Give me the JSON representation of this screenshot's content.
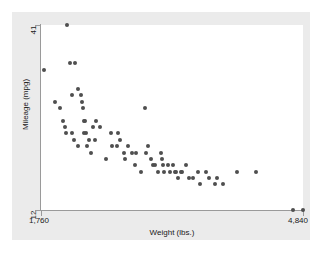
{
  "chart_data": {
    "type": "scatter",
    "title": "",
    "xlabel": "Weight (lbs.)",
    "ylabel": "Mileage (mpg)",
    "xlim": [
      1760,
      4840
    ],
    "ylim": [
      12,
      41
    ],
    "xticks": [
      1760,
      4840
    ],
    "xtick_labels": [
      "1,760",
      "4,840"
    ],
    "yticks": [
      12,
      41
    ],
    "ytick_labels": [
      "12",
      "41"
    ],
    "grid": false,
    "legend": "none",
    "marker": "filled-circle",
    "marker_color": "#4f4f4f",
    "plot_background": "#ffffff",
    "graph_background": "#ebebeb",
    "axis_color": "#9a9a9a",
    "n_points": 74,
    "series": [
      {
        "name": "Automobiles",
        "x": [
          2070,
          2100,
          2160,
          2200,
          2230,
          2250,
          2280,
          2290,
          2370,
          2400,
          1800,
          1930,
          1980,
          2020,
          2040,
          2050,
          2120,
          2130,
          2150,
          2190,
          2240,
          2260,
          2270,
          2300,
          2320,
          2350,
          2410,
          2450,
          2520,
          2580,
          2600,
          2650,
          2670,
          2690,
          2730,
          2750,
          2780,
          2830,
          2860,
          2880,
          2930,
          2980,
          3000,
          3020,
          3050,
          3080,
          3100,
          3130,
          3170,
          3180,
          3200,
          3210,
          3250,
          3280,
          3310,
          3330,
          3350,
          3370,
          3400,
          3420,
          3470,
          3500,
          3550,
          3600,
          3630,
          3700,
          3730,
          3800,
          3830,
          3900,
          4060,
          4290,
          4720,
          4840
        ],
        "y": [
          41,
          35,
          35,
          31,
          30,
          28,
          26,
          24,
          25,
          23,
          34,
          29,
          28,
          26,
          25,
          24,
          30,
          24,
          23,
          22,
          29,
          26,
          24,
          22,
          23,
          21,
          26,
          25,
          20,
          24,
          22,
          22,
          24,
          23,
          21,
          20,
          22,
          21,
          19,
          21,
          18,
          28,
          21,
          22,
          20,
          19,
          19,
          18,
          21,
          20,
          19,
          18,
          19,
          18,
          19,
          18,
          18,
          17,
          18,
          18,
          19,
          17,
          17,
          18,
          16,
          18,
          17,
          16,
          17,
          16,
          18,
          18,
          12,
          12
        ]
      }
    ]
  },
  "axes": {
    "y_title": "Mileage (mpg)",
    "x_title": "Weight (lbs.)",
    "y_tick_top": "41",
    "y_tick_bottom": "12",
    "x_tick_left": "1,760",
    "x_tick_right": "4,840"
  }
}
